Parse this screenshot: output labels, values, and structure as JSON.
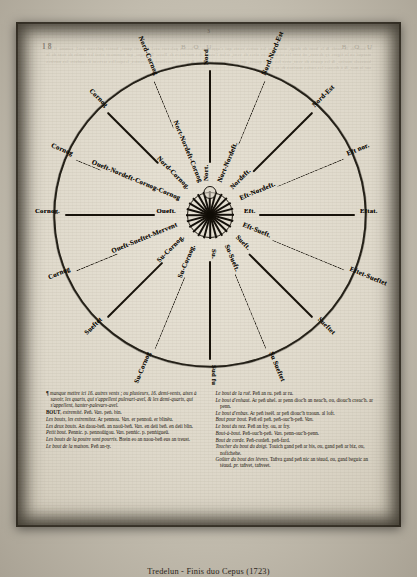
{
  "caption": "Tredelun - Finis duo Cepus (1723)",
  "page": {
    "folio": "18",
    "running_head_left": "B O U",
    "running_head_right": "B O U",
    "signature": "3"
  },
  "figure": {
    "name": "compass-rose",
    "center_label": "",
    "rays": [
      {
        "angle": -90,
        "breton": "Nort.",
        "french": "Nord",
        "dashed": false
      },
      {
        "angle": -67.5,
        "breton": "Nort-Nordeft.",
        "french": "Nord-Nord-Est",
        "dashed": true
      },
      {
        "angle": -45,
        "breton": "Nordeft.",
        "french": "Nord-Est",
        "dashed": false
      },
      {
        "angle": -22.5,
        "breton": "Eft-Nordeft.",
        "french": "Eft nor.",
        "dashed": true
      },
      {
        "angle": 0,
        "breton": "Eft.",
        "french": "Eftat.",
        "dashed": false
      },
      {
        "angle": 22.5,
        "breton": "Eft-Sueft.",
        "french": "Eftet-Sueftet",
        "dashed": true
      },
      {
        "angle": 45,
        "breton": "Sueft.",
        "french": "Sueftet",
        "dashed": false
      },
      {
        "angle": 67.5,
        "breton": "Su-Sueft.",
        "french": "Su Sueftet",
        "dashed": true
      },
      {
        "angle": 90,
        "breton": "Su.",
        "french": "Sud fu",
        "dashed": false
      },
      {
        "angle": 112.5,
        "breton": "Su-Cornog.",
        "french": "Su-Cornog",
        "dashed": true
      },
      {
        "angle": 135,
        "breton": "Su-Cornog.",
        "french": "Sueftet",
        "dashed": false
      },
      {
        "angle": 157.5,
        "breton": "Oueft-Sueftet-Mervent",
        "french": "Cornog",
        "dashed": true
      },
      {
        "angle": 180,
        "breton": "Oueft.",
        "french": "Cornog.",
        "dashed": false
      },
      {
        "angle": 202.5,
        "breton": "Oueft-Nordeft-Cornog-Cornog",
        "french": "Cornog",
        "dashed": true
      },
      {
        "angle": 225,
        "breton": "Nord-Cornog.",
        "french": "Cornog",
        "dashed": false
      },
      {
        "angle": 247.5,
        "breton": "Nort-Nordeft-Cornog",
        "french": "Nord-Cornog",
        "dashed": true
      }
    ]
  },
  "text_columns": {
    "left": [
      "<span class='pilcrow'>¶</span> <span class='it'>manque mettre ici 16. autres vents ; ou plusieurs, 16. demi-vents, aises à savoir, les quarts, qui s'appellent pulevart-avel, &amp; les demi-quarts, qui s'appellent, hanter-palevars-avel.</span>",
      "<span class='sc'>BOUT</span>, <span class='it'>extremité.</span> Peñ. <span class='it'>Van.</span> peṅ. bin.",
      "<span class='it'>Les bouts, les extremitez.</span> Ar pennou. <span class='it'>Van.</span> er pennoü. er blinëu.",
      "<span class='it'>Les deux bouts.</span> An daou-beñ. an naoü-beñ. <span class='it'>Van.</span> en deii beñ. en deii blin.",
      "<span class='it'>Petit bout.</span> Pennic. p. pennoüigou. <span class='it'>Van.</span> penṅic. p. penṅigueü.",
      "<span class='it'>Les bouts de la poutre sont pourris.</span> Brein eo an naou-beñ eus an treust.",
      "<span class='it'>Le bout de la maison.</span> Peñ an-ty."
    ],
    "right": [
      "<span class='it'>Le bout de la ruë.</span> Peñ an ru. peñ ar ru.",
      "<span class='it'>Le bout d'enhaut.</span> Ar peñ uhel. ar penn dioc'h an neac'h, <span class='it'>ou</span>, diouc'h creac'h. ar penn.",
      "<span class='it'>Le bout d'enbas.</span> Ar peñ iseël. ar peñ diouc'h traoun. al loft.",
      "<span class='it'>Bout pour bout.</span> Peñ eil peñ. peñ-ouc'h-peñ. <span class='it'>Van.</span>",
      "<span class='it'>Le bout du nez.</span> Peñ an fry. ou, ar fry.",
      "<span class='it'>Bout-à-bout.</span> Peñ-ouc'h-peñ. <span class='it'>Van.</span> penn-ouc'h-penn.",
      "<span class='it'>Bout de corde.</span> Peñ-cordeñ. peñ-fard.",
      "<span class='it'>Toucher du bout du doigt.</span> Touich gand peñ ar bis, <span class='it'>ou</span>, gand peñ ar biz, <span class='it'>ou</span>, nofichehe.",
      "<span class='it'>Goûter du bout des lévres.</span> Tañva gand peñ nic an téaud, <span class='it'>ou</span>, gand beguic an téaud. <span class='it'>pr.</span> tañvet, tañveet."
    ]
  },
  "bleed_text": "le bout de la corde & le bout du doigt, ainsi que les autres vents qui s'appellent en breton palevart avel & demi quart, hanter palevars avel, comme il est marqué en la figure cy dessus, où sont les trente-deux aires de vent, selon l'usage des mariniers de Basse-Bretagne, qui nomment ainsi les rumbs de vent de la boussole marine, & les quarts de vent, avec les demi quarts, qui sont en tout soixante & quatre directions differentes, lesquelles servent à conduire les navires sur la mer, & à dresser les cartes marines de ce pays."
}
